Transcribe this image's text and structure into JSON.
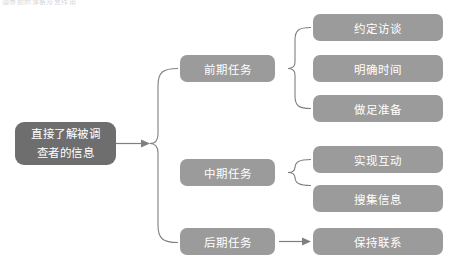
{
  "page": {
    "top_fragment": "调查前的准备及其作用"
  },
  "diagram": {
    "type": "hierarchy-brace-tree",
    "colors": {
      "root_fill": "#6e6e6e",
      "node_fill": "#9b9b9b",
      "connector": "#7f7f7f",
      "text": "#ffffff",
      "background": "#ffffff"
    },
    "root": {
      "label_line1": "直接了解被调",
      "label_line2": "查者的信息"
    },
    "branches": [
      {
        "label": "前期任务",
        "connector": "brace",
        "children": [
          {
            "label": "约定访谈"
          },
          {
            "label": "明确时间"
          },
          {
            "label": "做足准备"
          }
        ]
      },
      {
        "label": "中期任务",
        "connector": "brace",
        "children": [
          {
            "label": "实现互动"
          },
          {
            "label": "搜集信息"
          }
        ]
      },
      {
        "label": "后期任务",
        "connector": "arrow",
        "children": [
          {
            "label": "保持联系"
          }
        ]
      }
    ]
  }
}
